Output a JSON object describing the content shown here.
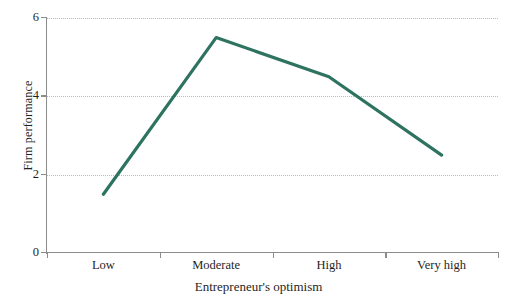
{
  "chart_data": {
    "type": "line",
    "title": "",
    "subtitle": "",
    "xlabel": "Entrepreneur's optimism",
    "ylabel": "Firm performance",
    "categories": [
      "Low",
      "Moderate",
      "High",
      "Very high"
    ],
    "values": [
      1.5,
      5.5,
      4.5,
      2.5
    ],
    "series": [
      {
        "name": "Firm performance",
        "values": [
          1.5,
          5.5,
          4.5,
          2.5
        ],
        "color": "#2e7360"
      }
    ],
    "ylim": [
      0,
      6
    ],
    "y_ticks": [
      "0",
      "2",
      "4",
      "6"
    ],
    "y_tick_values": [
      0,
      2,
      4,
      6
    ],
    "grid": "horizontal-dotted",
    "grid_values": [
      2,
      4,
      6
    ],
    "legend": "none",
    "annotations": []
  },
  "axes": {
    "y": {
      "label": "Firm performance",
      "ticks": [
        {
          "label": "6",
          "value": 6
        },
        {
          "label": "4",
          "value": 4
        },
        {
          "label": "2",
          "value": 2
        },
        {
          "label": "0",
          "value": 0
        }
      ]
    },
    "x": {
      "label": "Entrepreneur's optimism",
      "ticks": [
        {
          "label": "Low",
          "value": 1.5
        },
        {
          "label": "Moderate",
          "value": 5.5
        },
        {
          "label": "High",
          "value": 4.5
        },
        {
          "label": "Very high",
          "value": 2.5
        }
      ]
    }
  },
  "style": {
    "line_color": "#2e7360",
    "axis_color": "#8c8c8c",
    "grid_color": "#b9b9b9",
    "background": "#ffffff",
    "text_color": "#1f1f1f"
  }
}
